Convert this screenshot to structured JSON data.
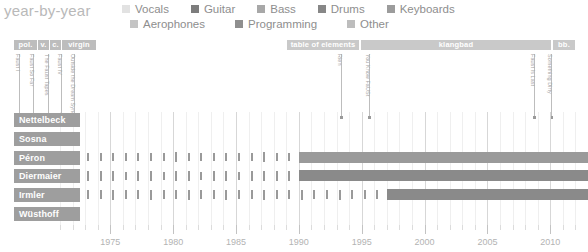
{
  "header": {
    "title": "year-by-year"
  },
  "legend": {
    "row1": [
      {
        "label": "Vocals",
        "color": "#e2e2e2",
        "icon": "legend-swatch"
      },
      {
        "label": "Guitar",
        "color": "#7d7d7d",
        "icon": "legend-swatch"
      },
      {
        "label": "Bass",
        "color": "#a8a8a8",
        "icon": "legend-swatch"
      },
      {
        "label": "Drums",
        "color": "#878787",
        "icon": "legend-swatch"
      },
      {
        "label": "Keyboards",
        "color": "#9c9c9c",
        "icon": "legend-swatch"
      }
    ],
    "row2": [
      {
        "label": "Aerophones",
        "color": "#c4c4c4",
        "icon": "legend-swatch"
      },
      {
        "label": "Programming",
        "color": "#8f8f8f",
        "icon": "legend-swatch"
      },
      {
        "label": "Other",
        "color": "#bdbdbd",
        "icon": "legend-swatch"
      }
    ]
  },
  "eras": [
    {
      "label": "pol.",
      "x": 14,
      "w": 23,
      "color": "#bdbdbd"
    },
    {
      "label": "v.",
      "x": 38,
      "w": 11,
      "color": "#bdbdbd"
    },
    {
      "label": "c.",
      "x": 50,
      "w": 11,
      "color": "#bdbdbd"
    },
    {
      "label": "virgin",
      "x": 62,
      "w": 34,
      "color": "#bdbdbd"
    },
    {
      "label": "table of elements",
      "x": 287,
      "w": 72,
      "color": "#c9c9c9"
    },
    {
      "label": "klangbad",
      "x": 361,
      "w": 190,
      "color": "#c9c9c9"
    },
    {
      "label": "bb.",
      "x": 553,
      "w": 22,
      "color": "#c9c9c9"
    }
  ],
  "releases": [
    {
      "label": "Faust I",
      "x": 19,
      "stem_top": 54,
      "stem_h": 63
    },
    {
      "label": "Faust So Far",
      "x": 33,
      "stem_top": 54,
      "stem_h": 63
    },
    {
      "label": "The Faust Tapes",
      "x": 48,
      "stem_top": 54,
      "stem_h": 63
    },
    {
      "label": "Faust IV",
      "x": 61,
      "stem_top": 54,
      "stem_h": 63
    },
    {
      "label": "Outside the Dream Syndicate",
      "x": 74,
      "stem_top": 54,
      "stem_h": 63
    },
    {
      "label": "Rien",
      "x": 341,
      "stem_top": 54,
      "stem_h": 63
    },
    {
      "label": "You Know FaUSt",
      "x": 369,
      "stem_top": 54,
      "stem_h": 63
    },
    {
      "label": "Faust Is Last",
      "x": 534,
      "stem_top": 54,
      "stem_h": 63
    },
    {
      "label": "Something Dirty",
      "x": 551,
      "stem_top": 54,
      "stem_h": 63
    }
  ],
  "chart_data": {
    "type": "bar",
    "title": "year-by-year",
    "xlabel": "",
    "ylabel": "",
    "xlim": [
      1971,
      2013
    ],
    "xticks_major": [
      1975,
      1980,
      1985,
      1990,
      1995,
      2000,
      2005,
      2010
    ],
    "xtick_labels": [
      "1975",
      "1980",
      "1985",
      "1990",
      "1995",
      "2000",
      "2005",
      "2010"
    ],
    "xticks_minor_step": 1,
    "grid": true,
    "legend_position": "top",
    "rows": [
      {
        "name": "Nettelbeck",
        "color": "#9e9e9e",
        "segments": [],
        "ticks": []
      },
      {
        "name": "Sosna",
        "color": "#9e9e9e",
        "segments": [],
        "ticks": []
      },
      {
        "name": "Péron",
        "color": "#9e9e9e",
        "segments": [
          {
            "start": 1990,
            "end": 2013,
            "color": "#9a9a9a"
          }
        ],
        "ticks": [
          {
            "year": 1972,
            "v": 0.85
          },
          {
            "year": 1973,
            "v": 0.8
          },
          {
            "year": 1974,
            "v": 0.75
          },
          {
            "year": 1975,
            "v": 0.8
          },
          {
            "year": 1976,
            "v": 0.7
          },
          {
            "year": 1977,
            "v": 0.75
          },
          {
            "year": 1978,
            "v": 0.8
          },
          {
            "year": 1979,
            "v": 0.7
          },
          {
            "year": 1980,
            "v": 0.85
          },
          {
            "year": 1981,
            "v": 0.75
          },
          {
            "year": 1982,
            "v": 0.7
          },
          {
            "year": 1983,
            "v": 0.8
          },
          {
            "year": 1984,
            "v": 0.75
          },
          {
            "year": 1985,
            "v": 0.7
          },
          {
            "year": 1986,
            "v": 0.8
          },
          {
            "year": 1987,
            "v": 0.85
          },
          {
            "year": 1988,
            "v": 0.75
          },
          {
            "year": 1989,
            "v": 0.7
          }
        ]
      },
      {
        "name": "Diermaier",
        "color": "#9e9e9e",
        "segments": [
          {
            "start": 1990,
            "end": 2013,
            "color": "#8a8a8a"
          }
        ],
        "ticks": [
          {
            "year": 1972,
            "v": 0.9
          },
          {
            "year": 1973,
            "v": 0.85
          },
          {
            "year": 1974,
            "v": 0.9
          },
          {
            "year": 1975,
            "v": 0.85
          },
          {
            "year": 1976,
            "v": 0.8
          },
          {
            "year": 1977,
            "v": 0.85
          },
          {
            "year": 1978,
            "v": 0.9
          },
          {
            "year": 1979,
            "v": 0.8
          },
          {
            "year": 1980,
            "v": 0.9
          },
          {
            "year": 1981,
            "v": 0.85
          },
          {
            "year": 1982,
            "v": 0.8
          },
          {
            "year": 1983,
            "v": 0.9
          },
          {
            "year": 1984,
            "v": 0.85
          },
          {
            "year": 1985,
            "v": 0.8
          },
          {
            "year": 1986,
            "v": 0.9
          },
          {
            "year": 1987,
            "v": 0.85
          },
          {
            "year": 1988,
            "v": 0.9
          },
          {
            "year": 1989,
            "v": 0.85
          }
        ]
      },
      {
        "name": "Irmler",
        "color": "#9e9e9e",
        "segments": [
          {
            "start": 1997,
            "end": 2013,
            "color": "#8a8a8a"
          }
        ],
        "ticks": [
          {
            "year": 1972,
            "v": 0.9
          },
          {
            "year": 1973,
            "v": 0.85
          },
          {
            "year": 1974,
            "v": 0.8
          },
          {
            "year": 1975,
            "v": 0.9
          },
          {
            "year": 1976,
            "v": 0.8
          },
          {
            "year": 1977,
            "v": 0.85
          },
          {
            "year": 1978,
            "v": 0.9
          },
          {
            "year": 1979,
            "v": 0.8
          },
          {
            "year": 1980,
            "v": 0.85
          },
          {
            "year": 1981,
            "v": 0.9
          },
          {
            "year": 1982,
            "v": 0.8
          },
          {
            "year": 1983,
            "v": 0.85
          },
          {
            "year": 1984,
            "v": 0.9
          },
          {
            "year": 1985,
            "v": 0.8
          },
          {
            "year": 1986,
            "v": 0.85
          },
          {
            "year": 1987,
            "v": 0.9
          },
          {
            "year": 1988,
            "v": 0.8
          },
          {
            "year": 1989,
            "v": 0.85
          },
          {
            "year": 1990,
            "v": 0.9
          },
          {
            "year": 1991,
            "v": 0.85
          },
          {
            "year": 1992,
            "v": 0.8
          },
          {
            "year": 1993,
            "v": 0.9
          },
          {
            "year": 1994,
            "v": 0.85
          },
          {
            "year": 1995,
            "v": 0.8
          },
          {
            "year": 1996,
            "v": 0.85
          }
        ]
      },
      {
        "name": "Wüsthoff",
        "color": "#9e9e9e",
        "segments": [],
        "ticks": []
      }
    ]
  }
}
